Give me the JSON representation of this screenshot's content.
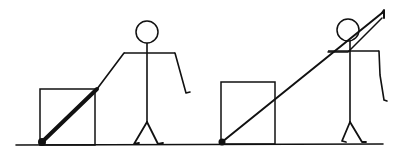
{
  "figure": {
    "stroke_color": "#111111",
    "background_color": "#ffffff",
    "ground": {
      "x1": 16,
      "y1": 145,
      "x2": 383,
      "y2": 144,
      "width": 1.6
    },
    "panels": [
      {
        "id": "left",
        "box": {
          "x": 40,
          "y": 89,
          "w": 55,
          "h": 56
        },
        "pole": {
          "x1": 42,
          "y1": 142,
          "x2": 97,
          "y2": 89,
          "width": 4,
          "tip_radius": 4
        },
        "pole_arm": {
          "points": "97,89 124,53"
        },
        "figure": {
          "head": {
            "cx": 147,
            "cy": 32,
            "r": 11
          },
          "body": {
            "x1": 147,
            "y1": 43,
            "x2": 147,
            "y2": 122
          },
          "shoulders": {
            "x1": 124,
            "y1": 53,
            "x2": 175,
            "y2": 53
          },
          "free_arm": {
            "points": "175,53 186,93 190,92"
          },
          "legs": [
            {
              "points": "147,122 134,144 139,143"
            },
            {
              "points": "147,122 158,144 163,143"
            }
          ]
        }
      },
      {
        "id": "right",
        "box": {
          "x": 221,
          "y": 82,
          "w": 54,
          "h": 62
        },
        "pole": {
          "x1": 222,
          "y1": 142,
          "x2": 382,
          "y2": 13,
          "width": 2,
          "tip_radius": 3.5
        },
        "pole_hook": {
          "points": "382,13 384,10 384,18"
        },
        "pole_band": {
          "points": "328,52 348,52 382,18"
        },
        "figure": {
          "head": {
            "cx": 348,
            "cy": 30,
            "r": 11
          },
          "body": {
            "x1": 350,
            "y1": 41,
            "x2": 350,
            "y2": 122
          },
          "shoulders": {
            "x1": 328,
            "y1": 51,
            "x2": 379,
            "y2": 51
          },
          "free_arm": {
            "points": "379,51 380,75 384,100 387,101"
          },
          "legs": [
            {
              "points": "350,122 342,141 346,142"
            },
            {
              "points": "350,122 362,142 366,142"
            }
          ]
        }
      }
    ]
  }
}
